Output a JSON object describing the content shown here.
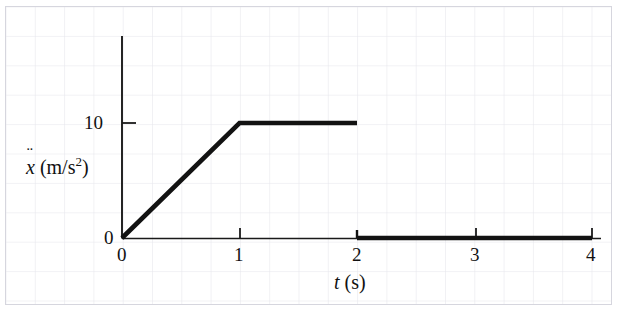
{
  "figure": {
    "background": "graph-paper",
    "grid_color": "#e6e6ec",
    "frame_color": "#d6d6de",
    "curve_color": "#121212",
    "axis_color": "#1a1a1a"
  },
  "axes": {
    "x_label_var": "t",
    "x_label_unit": "(s)",
    "y_label_var": "x",
    "y_label_accent": "¨",
    "y_label_unit_open": "(m/s",
    "y_label_unit_exp": "2",
    "y_label_unit_close": ")"
  },
  "ticks": {
    "x": [
      "0",
      "1",
      "2",
      "3",
      "4"
    ],
    "y": [
      "0",
      "10"
    ]
  },
  "chart_data": {
    "type": "line",
    "title": "",
    "subtitle": "",
    "xlabel": "t (s)",
    "ylabel": "ẍ (m/s²)",
    "xlim": [
      0,
      4
    ],
    "ylim": [
      0,
      14
    ],
    "xticks": [
      0,
      1,
      2,
      3,
      4
    ],
    "xtick_labels": [
      "0",
      "1",
      "2",
      "3",
      "4"
    ],
    "yticks": [
      0,
      10
    ],
    "ytick_labels": [
      "0",
      "10"
    ],
    "grid": true,
    "grid_style": "graph-paper",
    "legend": false,
    "legend_position": "none",
    "discontinuous": true,
    "series": [
      {
        "name": "acceleration",
        "segments": [
          {
            "name": "ramp",
            "points": [
              [
                0,
                0
              ],
              [
                1,
                10
              ]
            ]
          },
          {
            "name": "plateau",
            "points": [
              [
                1,
                10
              ],
              [
                2,
                10
              ]
            ]
          },
          {
            "name": "zero-hold",
            "points": [
              [
                2,
                0
              ],
              [
                4,
                0
              ]
            ]
          }
        ]
      }
    ],
    "annotations": [
      {
        "name": "step-discontinuity",
        "x": 2,
        "from_y": 10,
        "to_y": 0
      }
    ]
  }
}
